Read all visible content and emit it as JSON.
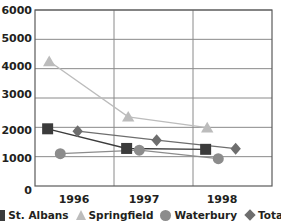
{
  "chart_data": {
    "type": "line",
    "title": "",
    "subtitle": "",
    "xlabel": "",
    "ylabel": "",
    "x": [
      "1996",
      "1997",
      "1998"
    ],
    "categories": [
      "1996",
      "1997",
      "1998"
    ],
    "xtick_labels": [
      "1996",
      "1997",
      "1998"
    ],
    "ytick_labels": [
      "0",
      "1000",
      "2000",
      "3000",
      "4000",
      "5000",
      "6000"
    ],
    "ytick_values": [
      0,
      1000,
      2000,
      3000,
      4000,
      5000,
      6000
    ],
    "ylim": [
      0,
      6000
    ],
    "grid": "horizontal-and-vertical",
    "legend_position": "bottom",
    "series": [
      {
        "name": "St. Albans",
        "marker": "square",
        "color": "#3b3b3b",
        "values": [
          1950,
          1280,
          1250
        ]
      },
      {
        "name": "Springfield",
        "marker": "triangle",
        "color": "#bcbcbc",
        "values": [
          4250,
          2360,
          1990
        ]
      },
      {
        "name": "Waterbury",
        "marker": "circle",
        "color": "#8c8c8c",
        "values": [
          1100,
          1220,
          930
        ]
      },
      {
        "name": "Total",
        "marker": "diamond",
        "color": "#6e6e6e",
        "values": [
          1870,
          1560,
          1270
        ]
      }
    ]
  },
  "legend": {
    "items": [
      {
        "label": "St. Albans",
        "marker": "square-marker-icon"
      },
      {
        "label": "Springfield",
        "marker": "triangle-marker-icon"
      },
      {
        "label": "Waterbury",
        "marker": "circle-marker-icon"
      },
      {
        "label": "Total",
        "marker": "diamond-marker-icon"
      }
    ]
  },
  "axes": {
    "y_labels": [
      "6000",
      "5000",
      "4000",
      "3000",
      "2000",
      "1000",
      "0"
    ],
    "x_labels": [
      "1996",
      "1997",
      "1998"
    ]
  }
}
